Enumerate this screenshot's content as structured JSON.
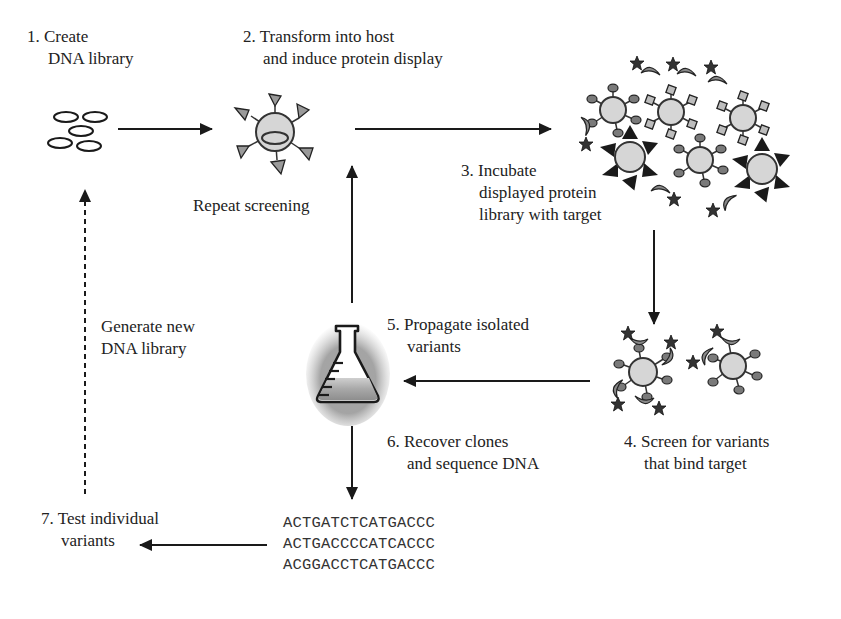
{
  "diagram": {
    "type": "flowchart",
    "steps": [
      {
        "id": 1,
        "number": "1.",
        "line1": "Create",
        "line2": "DNA library"
      },
      {
        "id": 2,
        "number": "2.",
        "line1": "Transform into host",
        "line2": "and induce protein display"
      },
      {
        "id": 3,
        "number": "3.",
        "line1": "Incubate",
        "line2": "displayed protein",
        "line3": "library with target"
      },
      {
        "id": 4,
        "number": "4.",
        "line1": "Screen for variants",
        "line2": "that bind target"
      },
      {
        "id": 5,
        "number": "5.",
        "line1": "Propagate isolated",
        "line2": "variants"
      },
      {
        "id": 6,
        "number": "6.",
        "line1": "Recover clones",
        "line2": "and sequence DNA"
      },
      {
        "id": 7,
        "number": "7.",
        "line1": "Test individual",
        "line2": "variants"
      }
    ],
    "annotations": {
      "repeat": "Repeat screening",
      "generate_line1": "Generate new",
      "generate_line2": "DNA library"
    },
    "sequences": [
      "ACTGATCTCATGACCC",
      "ACTGACCCCATCACCC",
      "ACGGACCTCATGACCC"
    ],
    "icons": {
      "dna_library": "plasmid-ovals-icon",
      "host_cell": "displaying-cell-icon",
      "incubation": "cell-population-with-targets-icon",
      "bound_variants": "bound-cells-icon",
      "flask": "erlenmeyer-flask-icon"
    },
    "edges": [
      {
        "from": 1,
        "to": 2,
        "style": "solid"
      },
      {
        "from": 2,
        "to": 3,
        "style": "solid"
      },
      {
        "from": 3,
        "to": 4,
        "style": "solid"
      },
      {
        "from": 4,
        "to": 5,
        "style": "solid"
      },
      {
        "from": 5,
        "to": 2,
        "style": "solid",
        "label": "Repeat screening"
      },
      {
        "from": 5,
        "to": 6,
        "style": "solid"
      },
      {
        "from": 6,
        "to": 7,
        "style": "solid"
      },
      {
        "from": 7,
        "to": 1,
        "style": "dashed",
        "label": "Generate new DNA library"
      }
    ],
    "colors": {
      "line": "#1a1a1a",
      "cell_fill": "#d9d9d9",
      "ligand_fill": "#8c8c8c",
      "target_fill": "#3a3a3a",
      "background": "#ffffff"
    }
  }
}
